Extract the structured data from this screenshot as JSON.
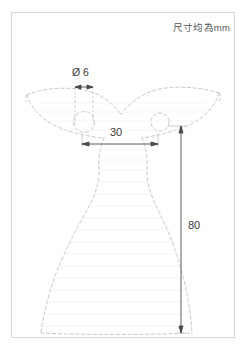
{
  "drawing": {
    "title_note": "尺寸均為mm",
    "units": "mm",
    "view": "front-elevation",
    "part_description": "fish-tail / flared skirt profile with two circular holes",
    "outline_style": "dashed",
    "outline_color": "#b9b9bd",
    "sheet_border_color": "#d8d8dc",
    "dimension_line_color": "#4a4a4e",
    "background_color": "#ffffff"
  },
  "dimensions": [
    {
      "id": "hole-diameter",
      "symbol": "Ø",
      "value": "6",
      "label": "Ø 6",
      "orientation": "horizontal",
      "feature": "circular-hole"
    },
    {
      "id": "neck-width",
      "symbol": "",
      "value": "30",
      "label": "30",
      "orientation": "horizontal",
      "feature": "top-body-width"
    },
    {
      "id": "overall-height",
      "symbol": "",
      "value": "80",
      "label": "80",
      "orientation": "vertical",
      "feature": "overall-height"
    }
  ]
}
